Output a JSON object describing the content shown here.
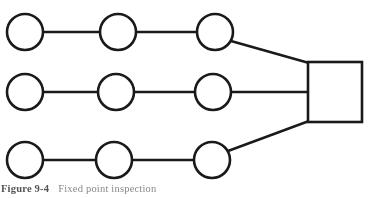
{
  "figure": {
    "caption_label": "Figure 9-4",
    "caption_text": "Fixed point inspection",
    "stroke_color": "#1a1a1a",
    "fill_color": "#ffffff",
    "background": "#ffffff"
  },
  "diagram": {
    "type": "node-link",
    "nodes": [
      {
        "id": "r1c1",
        "shape": "circle",
        "row": 1,
        "col": 1,
        "cx": 25,
        "cy": 32,
        "r": 18
      },
      {
        "id": "r1c2",
        "shape": "circle",
        "row": 1,
        "col": 2,
        "cx": 118,
        "cy": 32,
        "r": 18
      },
      {
        "id": "r1c3",
        "shape": "circle",
        "row": 1,
        "col": 3,
        "cx": 215,
        "cy": 32,
        "r": 18
      },
      {
        "id": "r2c1",
        "shape": "circle",
        "row": 2,
        "col": 1,
        "cx": 25,
        "cy": 92,
        "r": 18
      },
      {
        "id": "r2c2",
        "shape": "circle",
        "row": 2,
        "col": 2,
        "cx": 116,
        "cy": 92,
        "r": 18
      },
      {
        "id": "r2c3",
        "shape": "circle",
        "row": 2,
        "col": 3,
        "cx": 213,
        "cy": 92,
        "r": 18
      },
      {
        "id": "r3c1",
        "shape": "circle",
        "row": 3,
        "col": 1,
        "cx": 25,
        "cy": 160,
        "r": 18
      },
      {
        "id": "r3c2",
        "shape": "circle",
        "row": 3,
        "col": 2,
        "cx": 114,
        "cy": 160,
        "r": 18
      },
      {
        "id": "r3c3",
        "shape": "circle",
        "row": 3,
        "col": 3,
        "cx": 212,
        "cy": 160,
        "r": 18
      },
      {
        "id": "terminal",
        "shape": "square",
        "x": 308,
        "y": 62,
        "width": 54,
        "height": 60
      }
    ],
    "edges": [
      {
        "from": "r1c1",
        "to": "r1c2",
        "x1": 43,
        "y1": 32,
        "x2": 100,
        "y2": 32
      },
      {
        "from": "r1c2",
        "to": "r1c3",
        "x1": 136,
        "y1": 32,
        "x2": 197,
        "y2": 32
      },
      {
        "from": "r1c3",
        "to": "terminal",
        "x1": 231,
        "y1": 41,
        "x2": 309,
        "y2": 63
      },
      {
        "from": "r2c1",
        "to": "r2c2",
        "x1": 43,
        "y1": 92,
        "x2": 98,
        "y2": 92
      },
      {
        "from": "r2c2",
        "to": "r2c3",
        "x1": 134,
        "y1": 92,
        "x2": 195,
        "y2": 92
      },
      {
        "from": "r2c3",
        "to": "terminal",
        "x1": 231,
        "y1": 92,
        "x2": 309,
        "y2": 92
      },
      {
        "from": "r3c1",
        "to": "r3c2",
        "x1": 43,
        "y1": 160,
        "x2": 96,
        "y2": 160
      },
      {
        "from": "r3c2",
        "to": "r3c3",
        "x1": 132,
        "y1": 160,
        "x2": 194,
        "y2": 160
      },
      {
        "from": "r3c3",
        "to": "terminal",
        "x1": 228,
        "y1": 151,
        "x2": 309,
        "y2": 121
      }
    ]
  }
}
